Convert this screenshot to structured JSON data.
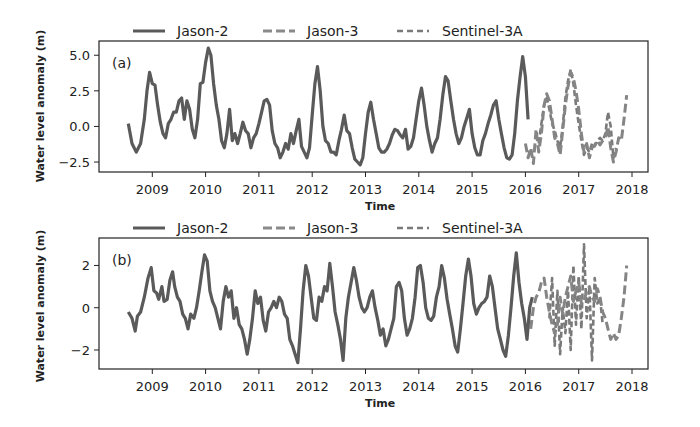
{
  "figure": {
    "width": 700,
    "height": 427,
    "line_color": "#5a5a5a",
    "dashed_color": "#7a7a7a",
    "axis_color": "#222222"
  },
  "legend": {
    "items": [
      {
        "label": "Jason-2",
        "style": "solid"
      },
      {
        "label": "Jason-3",
        "style": "dashed"
      },
      {
        "label": "Sentinel-3A",
        "style": "dotted-dash"
      }
    ]
  },
  "chart_data": [
    {
      "type": "line",
      "panel_label": "(a)",
      "title": "",
      "xlabel": "Time",
      "ylabel": "Water level anomaly (m)",
      "xlim": [
        2008.0,
        2018.3
      ],
      "ylim": [
        -3.2,
        6.0
      ],
      "xticks": [
        "2009",
        "2010",
        "2011",
        "2012",
        "2013",
        "2014",
        "2015",
        "2016",
        "2017",
        "2018"
      ],
      "yticks": [
        "5.0",
        "2.5",
        "0.0",
        "−2.5"
      ],
      "ytick_values": [
        5.0,
        2.5,
        0.0,
        -2.5
      ],
      "legend_position": "top, outside",
      "grid": false,
      "series": [
        {
          "name": "Jason-2",
          "style": "solid",
          "x": [
            2008.55,
            2008.62,
            2008.7,
            2008.78,
            2008.85,
            2008.9,
            2008.95,
            2009.0,
            2009.05,
            2009.1,
            2009.15,
            2009.2,
            2009.25,
            2009.3,
            2009.35,
            2009.4,
            2009.45,
            2009.5,
            2009.55,
            2009.6,
            2009.65,
            2009.7,
            2009.75,
            2009.8,
            2009.85,
            2009.9,
            2009.95,
            2010.0,
            2010.05,
            2010.1,
            2010.15,
            2010.2,
            2010.25,
            2010.3,
            2010.35,
            2010.4,
            2010.45,
            2010.5,
            2010.55,
            2010.6,
            2010.65,
            2010.7,
            2010.75,
            2010.8,
            2010.85,
            2010.9,
            2010.95,
            2011.0,
            2011.05,
            2011.1,
            2011.15,
            2011.2,
            2011.25,
            2011.3,
            2011.35,
            2011.4,
            2011.45,
            2011.5,
            2011.55,
            2011.6,
            2011.65,
            2011.7,
            2011.75,
            2011.8,
            2011.85,
            2011.9,
            2011.95,
            2012.0,
            2012.05,
            2012.1,
            2012.15,
            2012.2,
            2012.25,
            2012.3,
            2012.35,
            2012.4,
            2012.45,
            2012.5,
            2012.55,
            2012.6,
            2012.65,
            2012.7,
            2012.75,
            2012.8,
            2012.85,
            2012.9,
            2012.95,
            2013.0,
            2013.05,
            2013.1,
            2013.15,
            2013.2,
            2013.25,
            2013.3,
            2013.35,
            2013.4,
            2013.45,
            2013.5,
            2013.55,
            2013.6,
            2013.65,
            2013.7,
            2013.75,
            2013.8,
            2013.85,
            2013.9,
            2013.95,
            2014.0,
            2014.05,
            2014.1,
            2014.15,
            2014.2,
            2014.25,
            2014.3,
            2014.35,
            2014.4,
            2014.45,
            2014.5,
            2014.55,
            2014.6,
            2014.65,
            2014.7,
            2014.75,
            2014.8,
            2014.85,
            2014.9,
            2014.95,
            2015.0,
            2015.05,
            2015.1,
            2015.15,
            2015.2,
            2015.25,
            2015.3,
            2015.35,
            2015.4,
            2015.45,
            2015.5,
            2015.55,
            2015.6,
            2015.65,
            2015.7,
            2015.75,
            2015.8,
            2015.85,
            2015.9,
            2015.95,
            2016.0,
            2016.05,
            2016.1,
            2016.15,
            2016.2,
            2016.25,
            2016.3
          ],
          "y": [
            0.2,
            -1.2,
            -1.8,
            -1.2,
            0.5,
            2.5,
            3.8,
            3.0,
            2.9,
            1.5,
            0.3,
            -0.5,
            -0.8,
            0.2,
            0.5,
            1.0,
            1.0,
            1.8,
            2.0,
            0.5,
            1.8,
            1.2,
            -0.2,
            -0.8,
            0.5,
            3.0,
            3.1,
            4.5,
            5.5,
            5.0,
            3.0,
            1.5,
            0.5,
            -1.0,
            -1.5,
            -0.5,
            1.2,
            -1.0,
            -0.5,
            -1.2,
            -0.5,
            0.3,
            -0.3,
            -0.5,
            -1.5,
            -0.8,
            -0.5,
            0.2,
            1.0,
            1.8,
            1.9,
            1.5,
            -0.3,
            -1.2,
            -1.5,
            -2.2,
            -1.8,
            -1.2,
            -1.6,
            -0.5,
            -1.2,
            -0.3,
            0.5,
            -1.4,
            -1.8,
            -2.2,
            -1.5,
            0.8,
            3.0,
            4.2,
            2.5,
            0.0,
            -1.0,
            -1.2,
            -1.8,
            -1.8,
            -2.0,
            -1.0,
            -0.2,
            0.8,
            -0.3,
            -0.5,
            -1.5,
            -2.3,
            -2.5,
            -2.7,
            -2.2,
            -0.5,
            1.0,
            1.7,
            0.5,
            -0.5,
            -1.5,
            -1.8,
            -1.8,
            -1.6,
            -1.2,
            -0.6,
            -0.2,
            -0.3,
            -0.6,
            -0.8,
            -0.2,
            -1.6,
            -1.4,
            -0.8,
            0.5,
            1.8,
            2.7,
            1.5,
            0.0,
            -1.0,
            -1.8,
            -1.2,
            -0.8,
            0.5,
            2.2,
            3.5,
            3.2,
            1.8,
            0.5,
            -0.5,
            -1.2,
            -0.8,
            0.0,
            0.6,
            1.2,
            -0.5,
            -1.5,
            -2.0,
            -2.0,
            -1.0,
            -0.5,
            0.2,
            0.8,
            1.5,
            1.8,
            0.5,
            -0.5,
            -1.5,
            -2.2,
            -2.3,
            -2.0,
            -0.5,
            1.8,
            3.5,
            4.9,
            3.5,
            0.5
          ]
        },
        {
          "name": "Jason-3",
          "style": "dashed",
          "x": [
            2016.0,
            2016.05,
            2016.1,
            2016.15,
            2016.2,
            2016.25,
            2016.3,
            2016.35,
            2016.4,
            2016.45,
            2016.5,
            2016.55,
            2016.6,
            2016.65,
            2016.7,
            2016.75,
            2016.8,
            2016.85,
            2016.9,
            2016.95,
            2017.0,
            2017.05,
            2017.1,
            2017.15,
            2017.2,
            2017.25,
            2017.3,
            2017.35,
            2017.4,
            2017.45,
            2017.5,
            2017.55,
            2017.6,
            2017.65,
            2017.7,
            2017.75,
            2017.8,
            2017.85,
            2017.9
          ],
          "y": [
            -1.2,
            -2.2,
            -1.5,
            -2.6,
            -0.2,
            -1.8,
            -0.5,
            1.5,
            2.3,
            1.8,
            0.5,
            -0.8,
            -1.2,
            -2.0,
            -0.3,
            1.5,
            2.8,
            3.8,
            3.4,
            2.5,
            1.2,
            -0.5,
            -1.8,
            -1.2,
            -2.2,
            -1.5,
            -1.3,
            -1.0,
            -1.3,
            -1.0,
            -0.8,
            0.0,
            -1.5,
            -2.5,
            -1.8,
            -0.8,
            -1.0,
            0.5,
            2.2
          ]
        },
        {
          "name": "Sentinel-3A",
          "style": "dotted-dash",
          "x": [
            2016.2,
            2016.25,
            2016.3,
            2016.35,
            2016.4,
            2016.45,
            2016.5,
            2016.55,
            2016.6,
            2016.65,
            2016.7,
            2016.75,
            2016.8,
            2016.85,
            2016.9,
            2016.95,
            2017.0,
            2017.05,
            2017.1,
            2017.15,
            2017.2,
            2017.25,
            2017.3,
            2017.35,
            2017.4,
            2017.45,
            2017.5,
            2017.55,
            2017.6,
            2017.65,
            2017.7
          ],
          "y": [
            -0.6,
            -1.2,
            0.2,
            1.5,
            2.0,
            1.2,
            0.2,
            -0.3,
            -1.0,
            -1.5,
            0.0,
            2.0,
            3.2,
            4.0,
            3.0,
            1.5,
            0.2,
            -1.0,
            -2.0,
            -1.5,
            -1.8,
            -1.2,
            -1.4,
            -1.0,
            -0.8,
            -1.0,
            -0.5,
            1.0,
            0.0,
            -2.2,
            -1.5
          ]
        }
      ]
    },
    {
      "type": "line",
      "panel_label": "(b)",
      "title": "",
      "xlabel": "Time",
      "ylabel": "Water level anomaly (m)",
      "xlim": [
        2008.0,
        2018.3
      ],
      "ylim": [
        -2.9,
        3.3
      ],
      "xticks": [
        "2009",
        "2010",
        "2011",
        "2012",
        "2013",
        "2014",
        "2015",
        "2016",
        "2017",
        "2018"
      ],
      "yticks": [
        "2",
        "0",
        "−2"
      ],
      "ytick_values": [
        2,
        0,
        -2
      ],
      "legend_position": "top, outside",
      "grid": false,
      "series": [
        {
          "name": "Jason-2",
          "style": "solid",
          "x": [
            2008.55,
            2008.62,
            2008.68,
            2008.72,
            2008.78,
            2008.85,
            2008.92,
            2008.98,
            2009.03,
            2009.08,
            2009.12,
            2009.18,
            2009.22,
            2009.28,
            2009.33,
            2009.38,
            2009.42,
            2009.47,
            2009.52,
            2009.57,
            2009.62,
            2009.67,
            2009.72,
            2009.78,
            2009.83,
            2009.88,
            2009.93,
            2009.98,
            2010.03,
            2010.08,
            2010.13,
            2010.18,
            2010.23,
            2010.28,
            2010.33,
            2010.38,
            2010.43,
            2010.48,
            2010.53,
            2010.58,
            2010.63,
            2010.68,
            2010.73,
            2010.78,
            2010.83,
            2010.88,
            2010.93,
            2010.98,
            2011.03,
            2011.08,
            2011.13,
            2011.18,
            2011.23,
            2011.28,
            2011.33,
            2011.38,
            2011.43,
            2011.48,
            2011.53,
            2011.58,
            2011.63,
            2011.68,
            2011.73,
            2011.78,
            2011.83,
            2011.88,
            2011.93,
            2011.98,
            2012.03,
            2012.08,
            2012.13,
            2012.18,
            2012.23,
            2012.28,
            2012.33,
            2012.38,
            2012.43,
            2012.48,
            2012.53,
            2012.58,
            2012.63,
            2012.68,
            2012.73,
            2012.78,
            2012.83,
            2012.88,
            2012.93,
            2012.98,
            2013.03,
            2013.08,
            2013.13,
            2013.18,
            2013.23,
            2013.28,
            2013.33,
            2013.38,
            2013.43,
            2013.48,
            2013.53,
            2013.58,
            2013.63,
            2013.68,
            2013.73,
            2013.78,
            2013.83,
            2013.88,
            2013.93,
            2013.98,
            2014.03,
            2014.08,
            2014.13,
            2014.18,
            2014.23,
            2014.28,
            2014.33,
            2014.38,
            2014.43,
            2014.48,
            2014.53,
            2014.58,
            2014.63,
            2014.68,
            2014.73,
            2014.78,
            2014.83,
            2014.88,
            2014.93,
            2014.98,
            2015.03,
            2015.08,
            2015.13,
            2015.18,
            2015.23,
            2015.28,
            2015.33,
            2015.38,
            2015.43,
            2015.48,
            2015.53,
            2015.58,
            2015.63,
            2015.68,
            2015.73,
            2015.78,
            2015.83,
            2015.88,
            2015.93,
            2015.98,
            2016.03,
            2016.08,
            2016.13,
            2016.18,
            2016.23,
            2016.28,
            2016.33
          ],
          "y": [
            -0.2,
            -0.5,
            -1.1,
            -0.4,
            -0.2,
            0.5,
            1.4,
            1.9,
            0.8,
            0.7,
            0.4,
            1.0,
            0.3,
            0.4,
            1.3,
            1.7,
            1.0,
            0.5,
            0.3,
            -0.3,
            -0.5,
            -1.0,
            -0.3,
            -0.5,
            0.0,
            0.8,
            1.7,
            2.5,
            2.2,
            0.8,
            0.3,
            0.0,
            -0.5,
            -1.0,
            0.3,
            1.0,
            0.5,
            0.8,
            -0.5,
            0.0,
            -0.8,
            -1.0,
            -1.5,
            -2.2,
            -1.5,
            -0.5,
            0.8,
            0.2,
            0.5,
            -0.6,
            -1.1,
            -0.2,
            0.0,
            0.3,
            0.0,
            0.5,
            0.3,
            -0.3,
            -0.5,
            -1.5,
            -1.8,
            -2.2,
            -2.6,
            -1.0,
            0.8,
            2.0,
            1.5,
            0.5,
            -0.5,
            -0.6,
            0.5,
            0.3,
            1.0,
            0.8,
            2.1,
            1.0,
            -0.2,
            -0.8,
            -1.5,
            -2.5,
            -0.5,
            0.5,
            1.2,
            1.9,
            1.3,
            0.5,
            0.0,
            -0.2,
            0.0,
            0.5,
            0.8,
            0.0,
            -0.6,
            -1.3,
            -1.0,
            -1.8,
            -1.5,
            -1.0,
            -0.5,
            1.0,
            1.2,
            0.8,
            -0.5,
            -1.3,
            -1.0,
            -0.5,
            0.5,
            1.9,
            2.0,
            1.2,
            0.0,
            -0.5,
            -0.6,
            -0.4,
            0.5,
            1.0,
            2.0,
            1.4,
            0.4,
            -0.3,
            -1.0,
            -1.8,
            -2.1,
            -1.0,
            0.2,
            1.5,
            2.3,
            1.5,
            0.2,
            -0.3,
            0.0,
            0.2,
            0.3,
            0.5,
            1.5,
            1.0,
            0.0,
            -1.0,
            -1.5,
            -2.0,
            -2.3,
            -1.3,
            0.0,
            1.5,
            2.6,
            1.2,
            0.2,
            -0.5,
            -1.5,
            0.0,
            0.5
          ]
        },
        {
          "name": "Jason-3",
          "style": "dashed",
          "x": [
            2016.1,
            2016.15,
            2016.2,
            2016.25,
            2016.3,
            2016.35,
            2016.4,
            2016.45,
            2016.5,
            2016.55,
            2016.6,
            2016.65,
            2016.7,
            2016.75,
            2016.8,
            2016.85,
            2016.9,
            2016.95,
            2017.0,
            2017.05,
            2017.1,
            2017.15,
            2017.2,
            2017.25,
            2017.3,
            2017.35,
            2017.4,
            2017.45,
            2017.5,
            2017.55,
            2017.6,
            2017.65,
            2017.7,
            2017.75,
            2017.8,
            2017.85,
            2017.9
          ],
          "y": [
            -1.0,
            0.0,
            0.5,
            0.7,
            1.2,
            1.4,
            0.5,
            -0.2,
            -0.8,
            -1.2,
            -0.8,
            0.5,
            -0.3,
            0.5,
            1.0,
            1.5,
            0.3,
            0.8,
            1.2,
            0.2,
            0.3,
            0.8,
            1.0,
            0.5,
            0.3,
            0.9,
            0.5,
            -0.2,
            -0.5,
            -1.0,
            -1.5,
            -1.2,
            -1.5,
            -1.3,
            -0.5,
            0.5,
            2.0
          ]
        },
        {
          "name": "Sentinel-3A",
          "style": "dotted-dash",
          "x": [
            2016.45,
            2016.5,
            2016.55,
            2016.6,
            2016.65,
            2016.7,
            2016.75,
            2016.8,
            2016.85,
            2016.9,
            2016.95,
            2017.0,
            2017.05,
            2017.1,
            2017.15,
            2017.2,
            2017.25,
            2017.3,
            2017.35,
            2017.4,
            2017.45
          ],
          "y": [
            -0.5,
            1.4,
            -1.8,
            0.8,
            -2.2,
            0.0,
            -1.2,
            0.8,
            -2.0,
            2.0,
            -0.8,
            1.5,
            -1.0,
            3.0,
            -0.5,
            1.0,
            -2.5,
            1.4,
            0.2,
            0.5,
            -0.8
          ]
        }
      ]
    }
  ]
}
